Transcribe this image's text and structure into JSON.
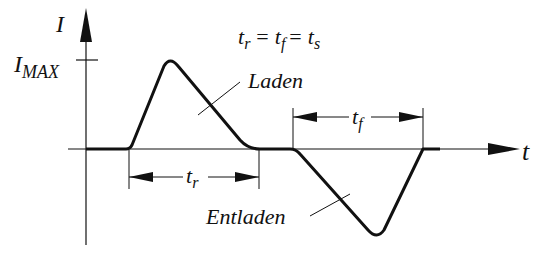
{
  "diagram": {
    "type": "current-time waveform",
    "axes": {
      "y_label": "I",
      "x_label": "t",
      "y_marker_main": "I",
      "y_marker_sub": "MAX"
    },
    "equation": {
      "t1": "t",
      "t1_sub": "r",
      "eq1": "=",
      "t2": "t",
      "t2_sub": "f",
      "eq2": "=",
      "t3": "t",
      "t3_sub": "s"
    },
    "labels": {
      "charge": "Laden",
      "discharge": "Entladen"
    },
    "dimensions": {
      "rise_main": "t",
      "rise_sub": "r",
      "fall_main": "t",
      "fall_sub": "f"
    },
    "colors": {
      "line": "#111111",
      "background": "#ffffff"
    }
  }
}
